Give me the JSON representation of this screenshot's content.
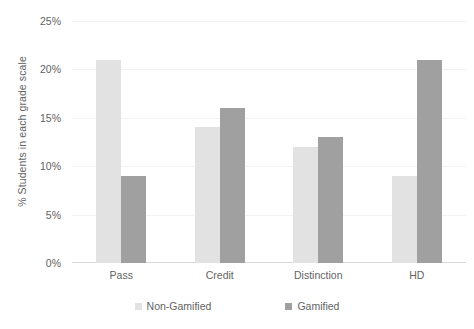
{
  "chart_data": {
    "type": "bar",
    "title": "",
    "subtitle": "",
    "xlabel": "",
    "ylabel": "% Students in each grade scale",
    "categories": [
      "Pass",
      "Credit",
      "Distinction",
      "HD"
    ],
    "series": [
      {
        "name": "Non-Gamified",
        "color": "#e2e2e2",
        "values": [
          21,
          14,
          12,
          9
        ]
      },
      {
        "name": "Gamified",
        "color": "#a0a0a0",
        "values": [
          9,
          16,
          13,
          21
        ]
      }
    ],
    "ylim": [
      0,
      25
    ],
    "ytick_values": [
      0,
      5,
      10,
      15,
      20,
      25
    ],
    "ytick_labels": [
      "0%",
      "5%",
      "10%",
      "15%",
      "20%",
      "25%"
    ],
    "grid": true,
    "grid_axis": "y",
    "legend_position": "bottom",
    "value_unit": "%"
  }
}
